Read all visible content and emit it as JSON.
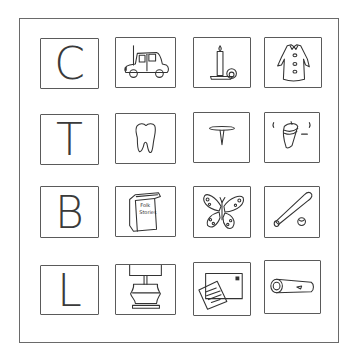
{
  "worksheet": {
    "rows": [
      [
        {
          "type": "letter",
          "value": "C"
        },
        {
          "type": "picture",
          "icon": "car-icon",
          "label": "car"
        },
        {
          "type": "picture",
          "icon": "candle-icon",
          "label": "candle"
        },
        {
          "type": "picture",
          "icon": "coat-icon",
          "label": "coat"
        }
      ],
      [
        {
          "type": "letter",
          "value": "T"
        },
        {
          "type": "picture",
          "icon": "tooth-icon",
          "label": "tooth"
        },
        {
          "type": "picture",
          "icon": "thumbtack-icon",
          "label": "tack"
        },
        {
          "type": "picture",
          "icon": "spinning-top-icon",
          "label": "top"
        }
      ],
      [
        {
          "type": "letter",
          "value": "B"
        },
        {
          "type": "picture",
          "icon": "book-icon",
          "label": "book",
          "cover_text": [
            "Folk",
            "Stories"
          ]
        },
        {
          "type": "picture",
          "icon": "butterfly-icon",
          "label": "butterfly"
        },
        {
          "type": "picture",
          "icon": "bat-and-ball-icon",
          "label": "bat and ball"
        }
      ],
      [
        {
          "type": "letter",
          "value": "L"
        },
        {
          "type": "picture",
          "icon": "lamp-icon",
          "label": "lamp"
        },
        {
          "type": "picture",
          "icon": "letter-envelope-icon",
          "label": "letter"
        },
        {
          "type": "picture",
          "icon": "log-icon",
          "label": "log"
        }
      ]
    ],
    "letters": {
      "r0": "C",
      "r1": "T",
      "r2": "B",
      "r3": "L"
    },
    "book_cover": {
      "line1": "Folk",
      "line2": "Stories"
    }
  }
}
